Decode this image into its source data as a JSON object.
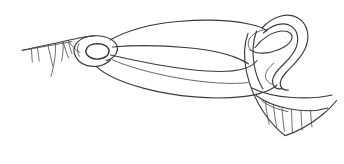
{
  "figure": {
    "title": "Hand-drawn line sketch",
    "medium": "ink line drawing",
    "canvas": {
      "width": "344",
      "height": "164",
      "background_color": "#ffffff"
    },
    "ink_color": "#3a3a42",
    "parts": [
      {
        "name": "upper-left-edge",
        "label": "Upper left diagonal edge with hanging hatch strokes"
      },
      {
        "name": "left-ring",
        "label": "Small ring / eyelet at left"
      },
      {
        "name": "upper-sweep",
        "label": "Long upper curve spanning left ring to right curl"
      },
      {
        "name": "middle-sweep",
        "label": "Middle curve crossing the others near the right"
      },
      {
        "name": "lower-sweep",
        "label": "Long lower curve forming the belly of the shape"
      },
      {
        "name": "right-curl",
        "label": "Large S-shaped curl at right"
      },
      {
        "name": "lower-right-edge",
        "label": "Lower right arc with vertical hatch strokes"
      }
    ]
  }
}
